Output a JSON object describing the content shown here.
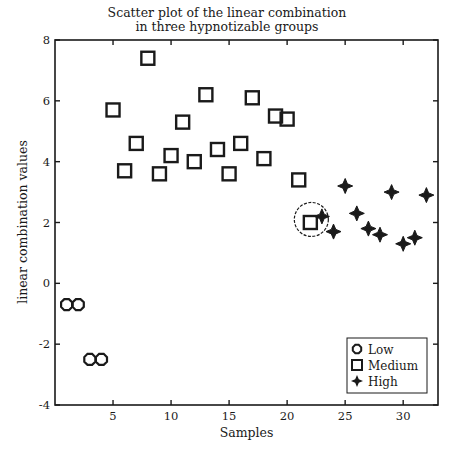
{
  "chart_data": {
    "type": "scatter",
    "title_lines": [
      "Scatter plot of the linear combination",
      "in three hypnotizable groups"
    ],
    "xlabel": "Samples",
    "ylabel": "linear combination values",
    "xlim": [
      0,
      33
    ],
    "ylim": [
      -4,
      8
    ],
    "xticks": [
      5,
      10,
      15,
      20,
      25,
      30
    ],
    "yticks": [
      -4,
      -2,
      0,
      2,
      4,
      6,
      8
    ],
    "grid": false,
    "legend_position": "lower right",
    "series": [
      {
        "name": "Low",
        "marker": "circle",
        "x": [
          1,
          2,
          3,
          4
        ],
        "y": [
          -0.7,
          -0.7,
          -2.5,
          -2.5
        ]
      },
      {
        "name": "Medium",
        "marker": "square",
        "x": [
          5,
          6,
          7,
          8,
          9,
          10,
          11,
          12,
          13,
          14,
          15,
          16,
          17,
          18,
          19,
          20,
          21,
          22
        ],
        "y": [
          5.7,
          3.7,
          4.6,
          7.4,
          3.6,
          4.2,
          5.3,
          4.0,
          6.2,
          4.4,
          3.6,
          4.6,
          6.1,
          4.1,
          5.5,
          5.4,
          3.4,
          2.0
        ]
      },
      {
        "name": "High",
        "marker": "star",
        "x": [
          23,
          24,
          25,
          26,
          27,
          28,
          29,
          30,
          31,
          32
        ],
        "y": [
          2.2,
          1.7,
          3.2,
          2.3,
          1.8,
          1.6,
          3.0,
          1.3,
          1.5,
          2.9
        ]
      }
    ],
    "annotations": [
      {
        "type": "circle",
        "around_sample": 22,
        "x": 22.0,
        "y": 2.1,
        "style": "dashed"
      }
    ]
  },
  "labels": {
    "title_line1": "Scatter plot of the linear combination",
    "title_line2": "in three hypnotizable groups",
    "xlabel": "Samples",
    "ylabel": "linear combination values"
  },
  "legend": {
    "items": [
      {
        "label": "Low",
        "marker": "circle"
      },
      {
        "label": "Medium",
        "marker": "square"
      },
      {
        "label": "High",
        "marker": "star"
      }
    ]
  }
}
